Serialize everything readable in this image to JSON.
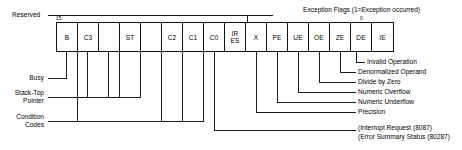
{
  "diagram": {
    "title_reserved": "Reserved",
    "exception_header": "Exception Flags (1=Exception occurred)",
    "bit_high": "15",
    "bit_low": "0"
  },
  "register": {
    "cells": [
      {
        "id": "bit15-busy",
        "line1": "B",
        "line2": ""
      },
      {
        "id": "bit14-c3",
        "line1": "C3",
        "line2": ""
      },
      {
        "id": "bit13-st2",
        "line1": "",
        "line2": ""
      },
      {
        "id": "bit12-st",
        "line1": "ST",
        "line2": ""
      },
      {
        "id": "bit11-st0",
        "line1": "",
        "line2": ""
      },
      {
        "id": "bit10-c2",
        "line1": "C2",
        "line2": ""
      },
      {
        "id": "bit9-c1",
        "line1": "C1",
        "line2": ""
      },
      {
        "id": "bit8-c0",
        "line1": "C0",
        "line2": ""
      },
      {
        "id": "bit7-ir-es",
        "line1": "IR",
        "line2": "ES"
      },
      {
        "id": "bit6-x",
        "line1": "X",
        "line2": ""
      },
      {
        "id": "bit5-pe",
        "line1": "PE",
        "line2": ""
      },
      {
        "id": "bit4-ue",
        "line1": "UE",
        "line2": ""
      },
      {
        "id": "bit3-oe",
        "line1": "OE",
        "line2": ""
      },
      {
        "id": "bit2-ze",
        "line1": "ZE",
        "line2": ""
      },
      {
        "id": "bit1-de",
        "line1": "DE",
        "line2": ""
      },
      {
        "id": "bit0-ie",
        "line1": "IE",
        "line2": ""
      }
    ]
  },
  "left_labels": [
    {
      "id": "busy",
      "line1": "Busy",
      "line2": ""
    },
    {
      "id": "stack-top",
      "line1": "Stack-Top",
      "line2": "Pointer"
    },
    {
      "id": "condition",
      "line1": "Condition",
      "line2": "Codes"
    }
  ],
  "right_labels": [
    {
      "id": "invalid-operation",
      "text": "Invalid Operation"
    },
    {
      "id": "denormalized-operand",
      "text": "Denormalized Operand"
    },
    {
      "id": "divide-by-zero",
      "text": "Divide by Zero"
    },
    {
      "id": "numeric-overflow",
      "text": "Numeric Overflow"
    },
    {
      "id": "numeric-underflow",
      "text": "Numeric Underflow"
    },
    {
      "id": "precision",
      "text": "Precision"
    },
    {
      "id": "interrupt-request",
      "text": "(Interrupt Request (8087)"
    },
    {
      "id": "error-summary-status",
      "text": "(Error Summary Status (80287)"
    }
  ]
}
